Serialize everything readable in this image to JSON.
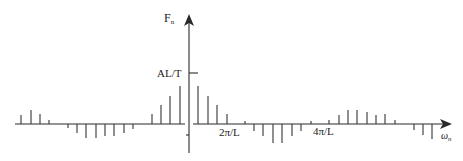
{
  "diagram": {
    "title": "",
    "y_axis": {
      "label": "F",
      "label_subscript": "n",
      "x": 189,
      "top": 15,
      "bottom": 153
    },
    "x_axis": {
      "label": "ω",
      "label_subscript": "n",
      "y": 124,
      "left": 15,
      "right": 452,
      "gap": [
        185,
        193
      ]
    },
    "annotations": [
      {
        "id": "al-t",
        "text": "AL/T",
        "type": "y-tick",
        "y": 73
      },
      {
        "id": "two-pi-l",
        "text": "2π/L",
        "type": "x-tick",
        "x": 245
      },
      {
        "id": "four-pi-l",
        "text": "4π/L",
        "type": "x-tick",
        "x": 311
      }
    ],
    "spikes": [
      {
        "x": 21,
        "h": 9
      },
      {
        "x": 31,
        "h": 14
      },
      {
        "x": 40,
        "h": 10
      },
      {
        "x": 49,
        "h": 4
      },
      {
        "x": 68,
        "h": -4
      },
      {
        "x": 77,
        "h": -9
      },
      {
        "x": 86,
        "h": -14
      },
      {
        "x": 96,
        "h": -14
      },
      {
        "x": 105,
        "h": -12
      },
      {
        "x": 114,
        "h": -12
      },
      {
        "x": 124,
        "h": -9
      },
      {
        "x": 133,
        "h": -5
      },
      {
        "x": 152,
        "h": 10
      },
      {
        "x": 161,
        "h": 19
      },
      {
        "x": 170,
        "h": 28
      },
      {
        "x": 180,
        "h": 38
      },
      {
        "x": 198,
        "h": 38
      },
      {
        "x": 208,
        "h": 28
      },
      {
        "x": 217,
        "h": 19
      },
      {
        "x": 227,
        "h": 10
      },
      {
        "x": 245,
        "h": 3
      },
      {
        "x": 254,
        "h": -7
      },
      {
        "x": 263,
        "h": -12
      },
      {
        "x": 273,
        "h": -19
      },
      {
        "x": 282,
        "h": -19
      },
      {
        "x": 292,
        "h": -12
      },
      {
        "x": 301,
        "h": -7
      },
      {
        "x": 311,
        "h": 3
      },
      {
        "x": 329,
        "h": 4
      },
      {
        "x": 339,
        "h": 9
      },
      {
        "x": 348,
        "h": 14
      },
      {
        "x": 357,
        "h": 14
      },
      {
        "x": 367,
        "h": 12
      },
      {
        "x": 376,
        "h": 9
      },
      {
        "x": 385,
        "h": 10
      },
      {
        "x": 395,
        "h": 4
      },
      {
        "x": 414,
        "h": -6
      },
      {
        "x": 423,
        "h": -11
      },
      {
        "x": 432,
        "h": -15
      }
    ]
  }
}
